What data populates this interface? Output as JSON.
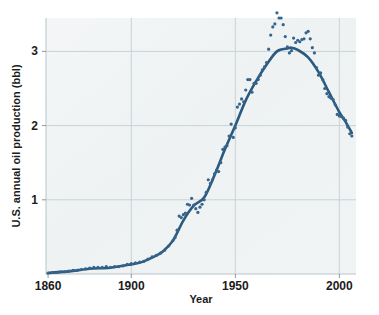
{
  "chart_data": {
    "type": "scatter",
    "title": "",
    "xlabel": "Year",
    "ylabel": "U.S. annual oil production (bbl)",
    "xlim": [
      1859,
      2008
    ],
    "ylim": [
      0,
      3.45
    ],
    "xticks": [
      1860,
      1900,
      1950,
      2000
    ],
    "xtick_labels": [
      "1860",
      "1900",
      "1950",
      "2000"
    ],
    "yticks": [
      1,
      2,
      3
    ],
    "ytick_labels": [
      "1",
      "2",
      "3"
    ],
    "grid": true,
    "legend": "none",
    "series": [
      {
        "name": "annual observations",
        "kind": "scatter",
        "marker": "circle",
        "color": "#35648c",
        "x": [
          1860,
          1862,
          1864,
          1866,
          1868,
          1870,
          1872,
          1874,
          1876,
          1878,
          1880,
          1882,
          1884,
          1886,
          1888,
          1890,
          1892,
          1894,
          1896,
          1898,
          1900,
          1902,
          1904,
          1906,
          1908,
          1910,
          1912,
          1914,
          1916,
          1918,
          1920,
          1921,
          1922,
          1923,
          1924,
          1925,
          1926,
          1927,
          1928,
          1929,
          1930,
          1931,
          1932,
          1933,
          1934,
          1935,
          1936,
          1937,
          1938,
          1939,
          1940,
          1941,
          1942,
          1943,
          1944,
          1945,
          1946,
          1947,
          1948,
          1949,
          1950,
          1951,
          1952,
          1953,
          1954,
          1955,
          1956,
          1957,
          1958,
          1959,
          1960,
          1961,
          1962,
          1963,
          1964,
          1965,
          1966,
          1967,
          1968,
          1969,
          1970,
          1971,
          1972,
          1973,
          1974,
          1975,
          1976,
          1977,
          1978,
          1979,
          1980,
          1981,
          1982,
          1983,
          1984,
          1985,
          1986,
          1987,
          1988,
          1989,
          1990,
          1991,
          1992,
          1993,
          1994,
          1995,
          1996,
          1997,
          1998,
          1999,
          2000,
          2001,
          2002,
          2003,
          2004,
          2005,
          2006
        ],
        "y": [
          0.01,
          0.02,
          0.02,
          0.03,
          0.03,
          0.04,
          0.05,
          0.05,
          0.06,
          0.07,
          0.08,
          0.09,
          0.09,
          0.09,
          0.1,
          0.09,
          0.1,
          0.1,
          0.11,
          0.13,
          0.14,
          0.15,
          0.16,
          0.17,
          0.2,
          0.23,
          0.25,
          0.28,
          0.32,
          0.38,
          0.45,
          0.49,
          0.59,
          0.78,
          0.76,
          0.8,
          0.82,
          0.94,
          0.93,
          1.02,
          0.93,
          0.88,
          0.83,
          0.9,
          0.94,
          1.0,
          1.1,
          1.27,
          1.22,
          1.27,
          1.35,
          1.4,
          1.38,
          1.5,
          1.68,
          1.71,
          1.73,
          1.86,
          2.02,
          1.84,
          1.97,
          2.25,
          2.29,
          2.36,
          2.32,
          2.48,
          2.62,
          2.62,
          2.45,
          2.57,
          2.57,
          2.62,
          2.68,
          2.75,
          2.79,
          2.85,
          3.03,
          3.22,
          3.33,
          3.37,
          3.52,
          3.45,
          3.45,
          3.36,
          3.2,
          3.06,
          2.98,
          3.01,
          3.18,
          3.12,
          3.15,
          3.13,
          3.16,
          3.17,
          3.25,
          3.27,
          3.17,
          3.05,
          2.98,
          2.78,
          2.68,
          2.71,
          2.62,
          2.5,
          2.43,
          2.39,
          2.37,
          2.35,
          2.28,
          2.15,
          2.13,
          2.12,
          2.1,
          2.07,
          1.98,
          1.89,
          1.86
        ],
        "note": "individual annual production values in billions of barrels"
      },
      {
        "name": "smoothed trend",
        "kind": "line",
        "color": "#2c597e",
        "x": [
          1860,
          1870,
          1880,
          1890,
          1900,
          1905,
          1910,
          1915,
          1920,
          1925,
          1930,
          1935,
          1940,
          1945,
          1950,
          1955,
          1960,
          1965,
          1970,
          1975,
          1977,
          1980,
          1985,
          1990,
          1995,
          2000,
          2003,
          2006
        ],
        "y": [
          0.015,
          0.035,
          0.07,
          0.085,
          0.13,
          0.16,
          0.22,
          0.3,
          0.45,
          0.72,
          0.92,
          1.03,
          1.33,
          1.68,
          2.0,
          2.34,
          2.6,
          2.82,
          3.0,
          3.04,
          3.05,
          3.02,
          2.92,
          2.72,
          2.45,
          2.18,
          2.05,
          1.9
        ]
      }
    ]
  }
}
